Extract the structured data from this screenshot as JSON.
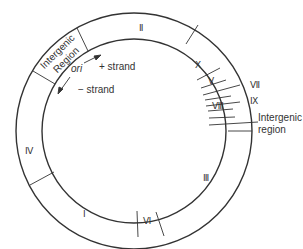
{
  "diagram": {
    "type": "circular genome map",
    "colors": {
      "line": "#333333",
      "background": "#ffffff"
    },
    "segments": [
      {
        "label": "II",
        "roman": "Ⅱ"
      },
      {
        "label": "X",
        "roman": "Ⅹ"
      },
      {
        "label": "V",
        "roman": "Ⅴ"
      },
      {
        "label": "VIII",
        "roman": "Ⅷ"
      },
      {
        "label": "III",
        "roman": "Ⅲ"
      },
      {
        "label": "VI",
        "roman": "Ⅵ"
      },
      {
        "label": "I",
        "roman": "Ⅰ"
      },
      {
        "label": "IV",
        "roman": "Ⅳ"
      }
    ],
    "callouts": {
      "vii": "Ⅶ",
      "ix": "Ⅸ",
      "intergenic_line1": "Intergenic",
      "intergenic_line2": "region"
    },
    "intergenic_region_inner": {
      "line1": "Intergenic",
      "line2": "Region"
    },
    "origin": {
      "label": "ori",
      "plus_strand": "+ strand",
      "minus_strand": "− strand"
    }
  }
}
